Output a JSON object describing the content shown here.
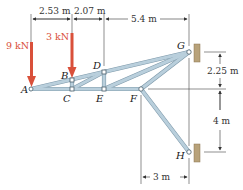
{
  "figure": {
    "nodes": {
      "A": "A",
      "B": "B",
      "C": "C",
      "D": "D",
      "E": "E",
      "F": "F",
      "G": "G",
      "H": "H"
    },
    "loads": [
      {
        "label": "9 kN",
        "at": "A"
      },
      {
        "label": "3 kN",
        "at": "B"
      }
    ],
    "dimensions": {
      "top_1": "2.53 m",
      "top_2": "2.07 m",
      "top_3": "5.4 m",
      "right_1": "2.25 m",
      "right_2": "4 m",
      "bottom_1": "3 m"
    },
    "colors": {
      "member_fill": "#b9cfdc",
      "member_edge": "#7f9aab",
      "load_arrow": "#d9503a",
      "wall": "#b8a27a"
    }
  }
}
